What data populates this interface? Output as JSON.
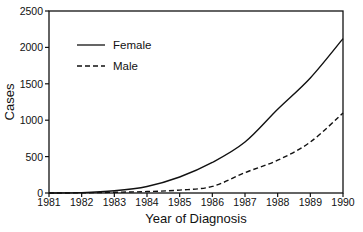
{
  "chart_data": {
    "type": "line",
    "title": "",
    "xlabel": "Year of Diagnosis",
    "ylabel": "Cases",
    "x": [
      1981,
      1982,
      1983,
      1984,
      1985,
      1986,
      1987,
      1988,
      1989,
      1990
    ],
    "xticks": [
      "1981",
      "1982",
      "1983",
      "1984",
      "1985",
      "1986",
      "1987",
      "1988",
      "1989",
      "1990"
    ],
    "yticks": [
      "0",
      "500",
      "1000",
      "1500",
      "2000",
      "2500"
    ],
    "ylim": [
      0,
      2500
    ],
    "xlim": [
      1981,
      1990
    ],
    "grid": false,
    "legend_position": "upper-left",
    "series": [
      {
        "name": "Female",
        "style": "solid",
        "values": [
          0,
          5,
          30,
          90,
          220,
          420,
          700,
          1150,
          1580,
          2120
        ]
      },
      {
        "name": "Male",
        "style": "dashed",
        "values": [
          0,
          2,
          10,
          20,
          40,
          90,
          280,
          450,
          700,
          1100
        ]
      }
    ]
  }
}
